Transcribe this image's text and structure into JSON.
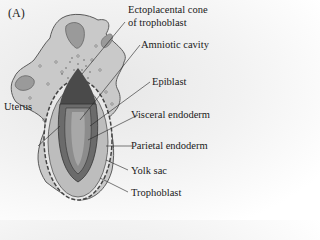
{
  "figure": {
    "panel_label": "(A)",
    "labels": {
      "ectoplacental_cone_line1": "Ectoplacental cone",
      "ectoplacental_cone_line2": "of trophoblast",
      "amniotic_cavity": "Amniotic cavity",
      "epiblast": "Epiblast",
      "uterus": "Uterus",
      "visceral_endoderm": "Visceral endoderm",
      "parietal_endoderm": "Parietal endoderm",
      "yolk_sac": "Yolk sac",
      "trophoblast": "Trophoblast"
    },
    "colors": {
      "uterus_fill": "#c9c9c9",
      "uterus_stroke": "#5a5a5a",
      "embryo_dark": "#4a4a4a",
      "yolk_sac_fill": "#b5b5b5",
      "cavity_fill": "#9a9a9a"
    }
  }
}
